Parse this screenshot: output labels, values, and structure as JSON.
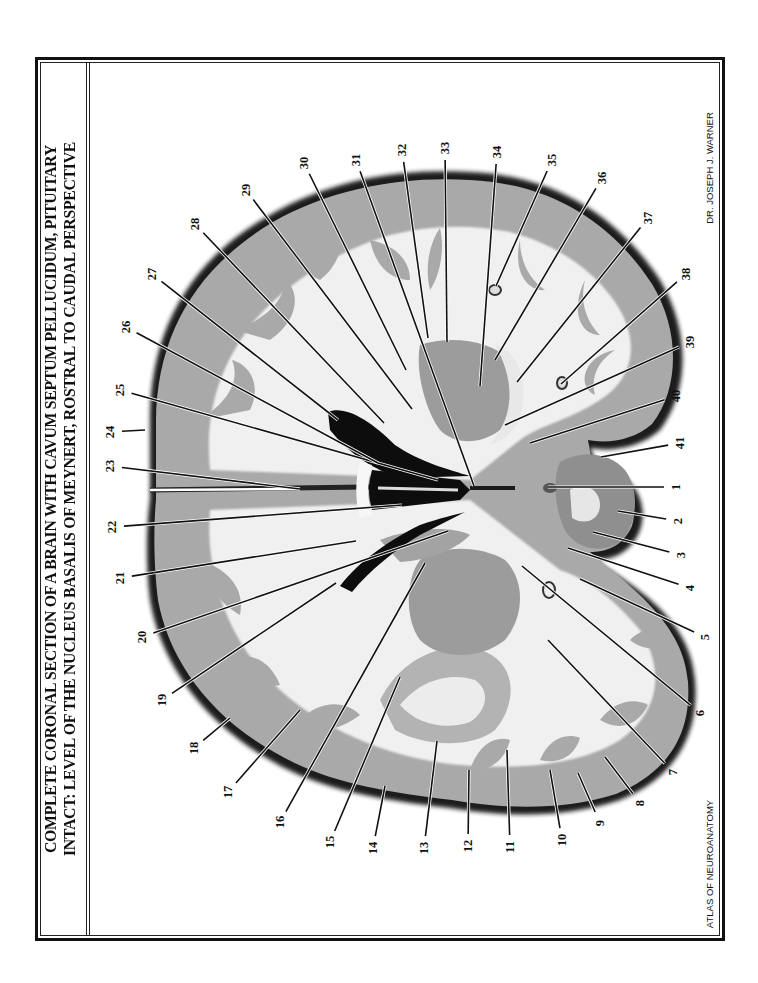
{
  "plate": {
    "title_line1": "COMPLETE CORONAL SECTION OF A BRAIN WITH CAVUM SEPTUM PELLUCIDUM, PITUITARY",
    "title_line2": "INTACT:  LEVEL OF THE NUCLEUS BASALIS OF MEYNERT, ROSTRAL TO CAUDAL PERSPECTIVE",
    "author": "DR. JOSEPH J. WARNER",
    "series": "ATLAS OF NEUROANATOMY",
    "orientation": "rotated-90-ccw",
    "colors": {
      "frame": "#111111",
      "white_matter": "#f2f2f2",
      "gray_matter": "#a8a8a8",
      "ventricle": "#0d0d0d",
      "leader_line": "#111111"
    }
  },
  "labels": [
    {
      "n": "1",
      "x": 676,
      "y": 487,
      "tx": 548,
      "ty": 487
    },
    {
      "n": "2",
      "x": 678,
      "y": 521,
      "tx": 618,
      "ty": 511
    },
    {
      "n": "3",
      "x": 681,
      "y": 555,
      "tx": 593,
      "ty": 532
    },
    {
      "n": "4",
      "x": 690,
      "y": 588,
      "tx": 568,
      "ty": 548
    },
    {
      "n": "5",
      "x": 705,
      "y": 637,
      "tx": 580,
      "ty": 579
    },
    {
      "n": "6",
      "x": 700,
      "y": 713,
      "tx": 522,
      "ty": 566
    },
    {
      "n": "7",
      "x": 673,
      "y": 772,
      "tx": 548,
      "ty": 640
    },
    {
      "n": "8",
      "x": 640,
      "y": 803,
      "tx": 605,
      "ty": 757
    },
    {
      "n": "9",
      "x": 600,
      "y": 823,
      "tx": 578,
      "ty": 773
    },
    {
      "n": "10",
      "x": 562,
      "y": 840,
      "tx": 550,
      "ty": 770
    },
    {
      "n": "11",
      "x": 510,
      "y": 847,
      "tx": 507,
      "ty": 750
    },
    {
      "n": "12",
      "x": 468,
      "y": 846,
      "tx": 469,
      "ty": 770
    },
    {
      "n": "13",
      "x": 424,
      "y": 848,
      "tx": 437,
      "ty": 741
    },
    {
      "n": "14",
      "x": 373,
      "y": 848,
      "tx": 385,
      "ty": 786
    },
    {
      "n": "15",
      "x": 330,
      "y": 842,
      "tx": 400,
      "ty": 677
    },
    {
      "n": "16",
      "x": 280,
      "y": 822,
      "tx": 425,
      "ty": 563
    },
    {
      "n": "17",
      "x": 228,
      "y": 792,
      "tx": 300,
      "ty": 710
    },
    {
      "n": "18",
      "x": 194,
      "y": 748,
      "tx": 230,
      "ty": 718
    },
    {
      "n": "19",
      "x": 162,
      "y": 700,
      "tx": 336,
      "ty": 583
    },
    {
      "n": "20",
      "x": 142,
      "y": 637,
      "tx": 448,
      "ty": 531
    },
    {
      "n": "21",
      "x": 120,
      "y": 578,
      "tx": 356,
      "ty": 541
    },
    {
      "n": "22",
      "x": 112,
      "y": 527,
      "tx": 402,
      "ty": 505
    },
    {
      "n": "23",
      "x": 110,
      "y": 466,
      "tx": 300,
      "ty": 489
    },
    {
      "n": "24",
      "x": 110,
      "y": 432,
      "tx": 145,
      "ty": 430
    },
    {
      "n": "25",
      "x": 120,
      "y": 390,
      "tx": 438,
      "ty": 480
    },
    {
      "n": "26",
      "x": 126,
      "y": 327,
      "tx": 378,
      "ty": 463
    },
    {
      "n": "27",
      "x": 152,
      "y": 274,
      "tx": 338,
      "ty": 420
    },
    {
      "n": "28",
      "x": 195,
      "y": 224,
      "tx": 384,
      "ty": 423
    },
    {
      "n": "29",
      "x": 246,
      "y": 190,
      "tx": 412,
      "ty": 409
    },
    {
      "n": "30",
      "x": 304,
      "y": 163,
      "tx": 406,
      "ty": 370
    },
    {
      "n": "31",
      "x": 356,
      "y": 160,
      "tx": 474,
      "ty": 486
    },
    {
      "n": "32",
      "x": 402,
      "y": 150,
      "tx": 428,
      "ty": 338
    },
    {
      "n": "33",
      "x": 445,
      "y": 148,
      "tx": 447,
      "ty": 342
    },
    {
      "n": "34",
      "x": 497,
      "y": 152,
      "tx": 480,
      "ty": 386
    },
    {
      "n": "35",
      "x": 552,
      "y": 160,
      "tx": 496,
      "ty": 286
    },
    {
      "n": "36",
      "x": 602,
      "y": 178,
      "tx": 495,
      "ty": 360
    },
    {
      "n": "37",
      "x": 648,
      "y": 218,
      "tx": 517,
      "ty": 382
    },
    {
      "n": "38",
      "x": 686,
      "y": 274,
      "tx": 561,
      "ty": 384
    },
    {
      "n": "39",
      "x": 690,
      "y": 342,
      "tx": 505,
      "ty": 425
    },
    {
      "n": "40",
      "x": 676,
      "y": 396,
      "tx": 530,
      "ty": 443
    },
    {
      "n": "41",
      "x": 680,
      "y": 443,
      "tx": 601,
      "ty": 457
    }
  ]
}
